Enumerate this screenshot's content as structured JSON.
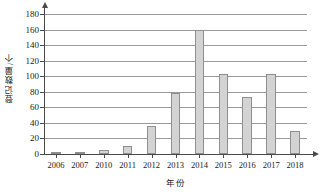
{
  "chart_data": {
    "type": "bar",
    "title": "",
    "subtitle": "",
    "xlabel": "年份",
    "ylabel": "登记数量/个",
    "categories": [
      "2006",
      "2007",
      "2010",
      "2011",
      "2012",
      "2013",
      "2014",
      "2015",
      "2016",
      "2017",
      "2018"
    ],
    "values": [
      2,
      2,
      5,
      10,
      36,
      78,
      159,
      103,
      73,
      103,
      30
    ],
    "ylim": [
      0,
      180
    ],
    "ytick_values": [
      0,
      20,
      40,
      60,
      80,
      100,
      120,
      140,
      160,
      180
    ],
    "ytick_labels": [
      "0",
      "20",
      "40",
      "60",
      "80",
      "100",
      "120",
      "140",
      "160",
      "180"
    ],
    "grid": "horizontal",
    "legend": "none",
    "bar_color": "#d3d3d3",
    "bar_border_color": "#8f8f8f",
    "axis_color": "#4a4a4a",
    "grid_color": "#999999"
  }
}
